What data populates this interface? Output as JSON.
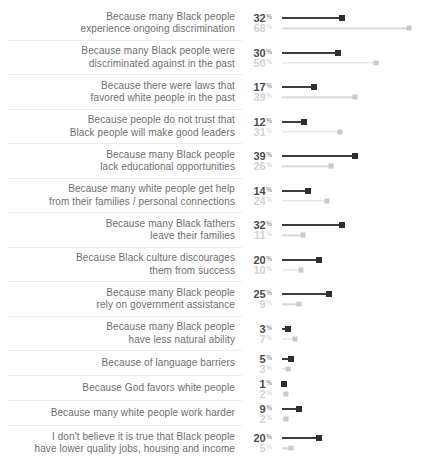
{
  "chart_data": {
    "type": "bar",
    "variant": "horizontal-lollipop-dumbbell",
    "unit": "%",
    "title": "",
    "xlabel": "",
    "ylabel": "",
    "xlim": [
      0,
      70
    ],
    "grid": false,
    "legend": "none",
    "categories": [
      "Because many Black people\nexperience ongoing discrimination",
      "Because many Black people were\ndiscriminated against in the past",
      "Because there were laws that\nfavored white people in the past",
      "Because people do not trust that\nBlack people will make good leaders",
      "Because many Black people\nlack educational opportunities",
      "Because many white people get help\nfrom their families / personal connections",
      "Because many Black fathers\nleave their families",
      "Because Black culture discourages\nthem from success",
      "Because many Black people\nrely on government assistance",
      "Because many Black people\nhave less natural ability",
      "Because of language barriers",
      "Because God favors white people",
      "Because many white people work harder",
      "I don't believe it is true that Black people\nhave lower quality jobs, housing and income"
    ],
    "series": [
      {
        "name": "dark",
        "color": "#2e2e2e",
        "values": [
          32,
          30,
          17,
          12,
          39,
          14,
          32,
          20,
          25,
          3,
          5,
          1,
          9,
          20
        ]
      },
      {
        "name": "light",
        "color": "#c9c9c9",
        "values": [
          68,
          50,
          39,
          31,
          26,
          24,
          11,
          10,
          9,
          7,
          3,
          2,
          2,
          5
        ]
      }
    ]
  },
  "colors": {
    "dark_value_text": "#4a4a4a",
    "light_value_text": "#d3d3d3",
    "label_text": "#6e6e6e",
    "divider": "#ededed",
    "dark_line": "#3c3c3c",
    "light_line": "#d9d9d9"
  }
}
